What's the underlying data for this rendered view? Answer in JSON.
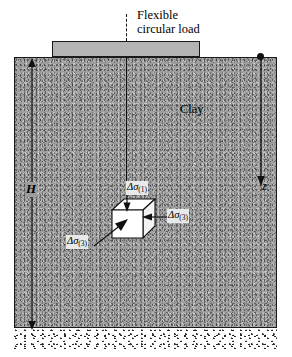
{
  "figure": {
    "labels": {
      "load_line1": "Flexible",
      "load_line2": "circular load",
      "soil": "Clay",
      "depth_total": "H",
      "depth_point": "z"
    },
    "stresses": [
      {
        "id": "vertical",
        "symbol": "Δσ",
        "subscript": "(1)",
        "position": "top-of-cube"
      },
      {
        "id": "lateral-right",
        "symbol": "Δσ",
        "subscript": "(3)",
        "position": "right-of-cube"
      },
      {
        "id": "lateral-front",
        "symbol": "Δσ",
        "subscript": "(3)",
        "position": "below-left-of-cube"
      }
    ],
    "colors": {
      "clay_fill": "#9d9d9d",
      "load_fill": "#b4b4b4",
      "sand_fill": "#ffffff",
      "line": "#111111",
      "cube_face": "#ffffff"
    }
  }
}
